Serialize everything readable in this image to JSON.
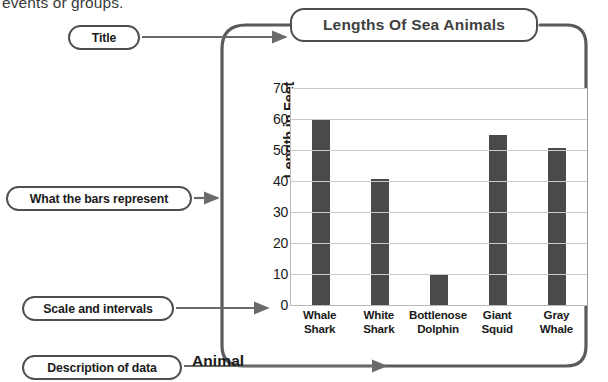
{
  "page": {
    "body_text_fragment": "events or groups."
  },
  "callouts": [
    {
      "id": "title",
      "label": "Title"
    },
    {
      "id": "bars",
      "label": "What the bars represent"
    },
    {
      "id": "scale",
      "label": "Scale and intervals"
    },
    {
      "id": "description",
      "label": "Description of data"
    }
  ],
  "colors": {
    "bar": "#4a4a4a",
    "gridline": "#cacaca",
    "callout_border": "#4f4f4f",
    "text": "#1a1a1a",
    "title_text": "#3f3f3f"
  },
  "chart_data": {
    "type": "bar",
    "title": "Lengths Of Sea Animals",
    "xlabel": "Animal",
    "ylabel": "Length in Feet",
    "categories": [
      "Whale Shark",
      "White Shark",
      "Bottlenose Dolphin",
      "Giant Squid",
      "Gray Whale"
    ],
    "category_lines": [
      [
        "Whale",
        "Shark"
      ],
      [
        "White",
        "Shark"
      ],
      [
        "Bottlenose",
        "Dolphin"
      ],
      [
        "Giant",
        "Squid"
      ],
      [
        "Gray",
        "Whale"
      ]
    ],
    "values": [
      60,
      40.5,
      10,
      55,
      50.5
    ],
    "ylim": [
      0,
      70
    ],
    "ytick_interval": 10,
    "yticks": [
      70,
      60,
      50,
      40,
      30,
      20,
      10,
      0
    ],
    "grid": true,
    "legend": false
  }
}
